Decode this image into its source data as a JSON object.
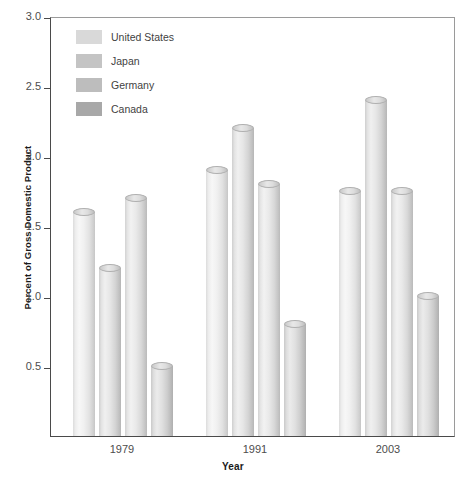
{
  "chart_data": {
    "type": "bar",
    "title": "",
    "xlabel": "Year",
    "ylabel": "Percent of Gross Domestic Product",
    "categories": [
      "1979",
      "1991",
      "2003"
    ],
    "series": [
      {
        "name": "United States",
        "values": [
          1.6,
          1.9,
          1.75
        ],
        "color": "#d9d9d9"
      },
      {
        "name": "Japan",
        "values": [
          1.2,
          2.2,
          2.4
        ],
        "color": "#c4c4c4"
      },
      {
        "name": "Germany",
        "values": [
          1.7,
          1.8,
          1.75
        ],
        "color": "#bdbdbd"
      },
      {
        "name": "Canada",
        "values": [
          0.5,
          0.8,
          1.0
        ],
        "color": "#a8a8a8"
      }
    ],
    "ylim": [
      0,
      3.0
    ],
    "ytick_values": [
      0.5,
      1.0,
      1.5,
      2.0,
      2.5,
      3.0
    ],
    "ytick_labels": [
      "0.5",
      "1.0",
      "1.5",
      "2.0",
      "2.5",
      "3.0"
    ],
    "grid": false,
    "legend_position": "top-left",
    "bar_style": "3d-cylinder"
  },
  "axes": {
    "y_title": "Percent of Gross Domestic Product",
    "x_title": "Year"
  },
  "legend": {
    "items": [
      {
        "label": "United States"
      },
      {
        "label": "Japan"
      },
      {
        "label": "Germany"
      },
      {
        "label": "Canada"
      }
    ]
  }
}
